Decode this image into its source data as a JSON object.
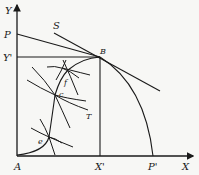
{
  "diagram": {
    "type": "edgeworth-box-production-possibility",
    "axes": {
      "y_label": "Y",
      "x_label": "X",
      "origin_label": "A"
    },
    "points": {
      "P": "P",
      "Y_prime": "Y'",
      "S": "S",
      "B": "B",
      "f": "f",
      "c": "c",
      "T": "T",
      "e": "e",
      "X_prime": "X'",
      "P_prime": "P'"
    },
    "colors": {
      "line": "#1a1a1a",
      "background": "#f7f7f5"
    }
  }
}
